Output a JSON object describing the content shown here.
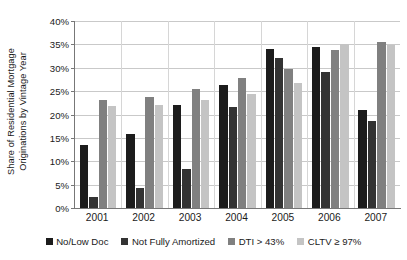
{
  "chart_data": {
    "type": "bar",
    "title": "",
    "subtitle": "",
    "xlabel": "",
    "ylabel": "Share of Residential Mortgage Originations by Vintage Year",
    "ylabel_line1": "Share of Residential Mortgage",
    "ylabel_line2": "Originations by Vintage Year",
    "categories": [
      "2001",
      "2002",
      "2003",
      "2004",
      "2005",
      "2006",
      "2007"
    ],
    "series": [
      {
        "name": "No/Low Doc",
        "color": "#1c1c1c",
        "values": [
          13.4,
          15.8,
          22.0,
          26.3,
          34.1,
          34.5,
          20.9
        ]
      },
      {
        "name": "Not Fully Amortized",
        "color": "#333333",
        "values": [
          2.4,
          4.3,
          8.3,
          21.6,
          32.1,
          29.2,
          18.7
        ]
      },
      {
        "name": "DTI > 43%",
        "color": "#808080",
        "values": [
          23.1,
          23.8,
          25.5,
          27.9,
          29.7,
          33.8,
          35.6
        ]
      },
      {
        "name": "CLTV ≥ 97%",
        "color": "#c4c4c4",
        "values": [
          21.9,
          22.1,
          23.0,
          24.4,
          26.7,
          35.0,
          34.8
        ]
      }
    ],
    "ylim": [
      0,
      40
    ],
    "ytick_values": [
      0,
      5,
      10,
      15,
      20,
      25,
      30,
      35,
      40
    ],
    "ytick_labels": [
      "0%",
      "5%",
      "10%",
      "15%",
      "20%",
      "25%",
      "30%",
      "35%",
      "40%"
    ],
    "grid": true,
    "grid_axis": "y",
    "legend_position": "bottom",
    "legend_entries": [
      "No/Low Doc",
      "Not Fully Amortized",
      "DTI > 43%",
      "CLTV ≥ 97%"
    ],
    "axis_color": "#777777",
    "grid_color": "#c9c9c9",
    "background_color": "#ffffff"
  }
}
